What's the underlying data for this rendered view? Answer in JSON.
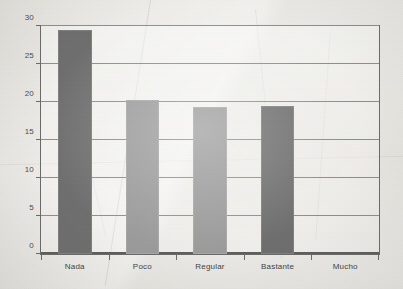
{
  "chart_data": {
    "type": "bar",
    "title": "",
    "subtitle": "",
    "xlabel": "",
    "ylabel": "",
    "categories": [
      "Nada",
      "Poco",
      "Regular",
      "Bastante",
      "Mucho"
    ],
    "values": [
      29.5,
      20.3,
      19.4,
      19.5,
      0
    ],
    "ylim": [
      0,
      30
    ],
    "yticks": [
      0,
      5,
      10,
      15,
      20,
      25,
      30
    ],
    "ytick_labels": [
      "0",
      "5",
      "10",
      "15",
      "20",
      "25",
      "30"
    ],
    "grid": true,
    "legend": "none",
    "bar_colors": [
      "#6e6e6e",
      "#9a9a9a",
      "#9a9a9a",
      "#6e6e6e",
      "#9a9a9a"
    ],
    "series": [
      {
        "name": "",
        "values": [
          29.5,
          20.3,
          19.4,
          19.5,
          0
        ]
      }
    ]
  },
  "style": {
    "axis_color": "#6a6a68",
    "gridline_color": "#8d8d8a",
    "baseline_color": "#5d5d5b",
    "label_color": "#3f3f3e",
    "paper_color": "#e9e8e4",
    "bar_dark": "#6e6e6e",
    "bar_light": "#9a9a9a"
  }
}
